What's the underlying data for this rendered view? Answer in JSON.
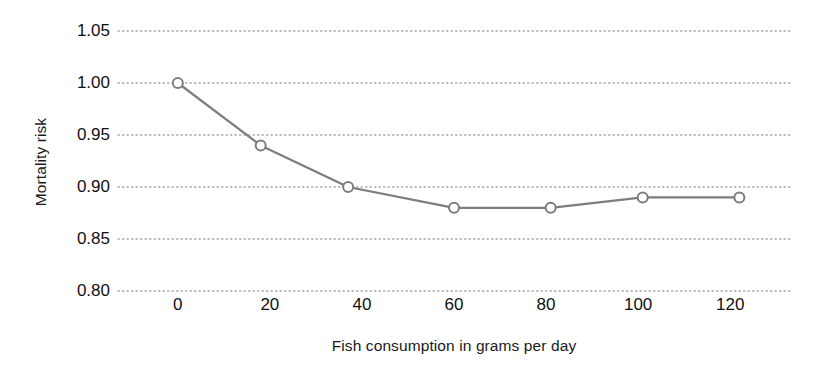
{
  "chart_data": {
    "type": "line",
    "title": "",
    "subtitle": "",
    "xlabel": "Fish consumption in grams per day",
    "ylabel": "Mortality risk",
    "x": [
      0,
      18,
      37,
      60,
      81,
      101,
      122
    ],
    "values": [
      1.0,
      0.94,
      0.9,
      0.88,
      0.88,
      0.89,
      0.89
    ],
    "series": [
      {
        "name": "Mortality risk",
        "x": [
          0,
          18,
          37,
          60,
          81,
          101,
          122
        ],
        "values": [
          1.0,
          0.94,
          0.9,
          0.88,
          0.88,
          0.89,
          0.89
        ]
      }
    ],
    "xlim": [
      -13,
      133
    ],
    "ylim": [
      0.8,
      1.05
    ],
    "xticks": [
      0,
      20,
      40,
      60,
      80,
      100,
      120
    ],
    "xtick_labels": [
      "0",
      "20",
      "40",
      "60",
      "80",
      "100",
      "120"
    ],
    "yticks": [
      0.8,
      0.85,
      0.9,
      0.95,
      1.0,
      1.05
    ],
    "ytick_labels": [
      "0.80",
      "0.85",
      "0.90",
      "0.95",
      "1.00",
      "1.05"
    ],
    "grid": {
      "horizontal": true,
      "vertical": false,
      "style": "dotted",
      "color": "#aaaaaa"
    },
    "legend": {
      "visible": false,
      "position": "none",
      "entries": []
    },
    "marker": {
      "shape": "circle-open",
      "fill": "#ffffff",
      "stroke": "#7d7d7d",
      "radius": 5
    },
    "line": {
      "color": "#7d7d7d",
      "width": 2.2
    },
    "colors": {
      "background": "#ffffff",
      "text": "#111111",
      "series": "#7d7d7d",
      "grid": "#aaaaaa"
    },
    "annotations": []
  }
}
